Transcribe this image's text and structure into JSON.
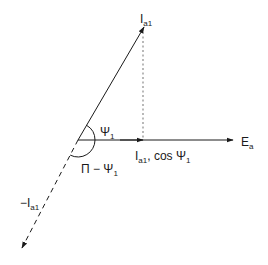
{
  "diagram": {
    "type": "phasor-diagram",
    "colors": {
      "stroke": "#1a1a1a",
      "dashed": "#888888",
      "background": "#ffffff"
    },
    "labels": {
      "ia1": {
        "main": "I",
        "sub": "a1"
      },
      "ea": {
        "main": "E",
        "sub": "a"
      },
      "psi1": {
        "main": "Ψ",
        "sub": "1"
      },
      "projection": {
        "main": "I",
        "sub": "a1",
        "tail": ", cos Ψ",
        "tail_sub": "1"
      },
      "pi_minus_psi": {
        "main": "Π − Ψ",
        "sub": "1"
      },
      "neg_ia1": {
        "main": "−I",
        "sub": "a1"
      }
    },
    "vectors": [
      {
        "name": "I_a1",
        "from": [
          78,
          140
        ],
        "to": [
          144,
          27
        ],
        "style": "solid"
      },
      {
        "name": "E_a",
        "from": [
          78,
          140
        ],
        "to": [
          233,
          140
        ],
        "style": "solid"
      },
      {
        "name": "I_a1 cos Ψ1",
        "from": [
          78,
          140
        ],
        "to": [
          143,
          140
        ],
        "style": "solid"
      },
      {
        "name": "-I_a1",
        "from": [
          78,
          140
        ],
        "to": [
          22,
          248
        ],
        "style": "dashed"
      },
      {
        "name": "projection-line",
        "from": [
          143,
          30
        ],
        "to": [
          143,
          140
        ],
        "style": "dotted"
      }
    ],
    "angles": [
      {
        "name": "Ψ1",
        "between": [
          "E_a",
          "I_a1"
        ]
      },
      {
        "name": "Π − Ψ1",
        "between": [
          "E_a",
          "-I_a1"
        ]
      }
    ]
  }
}
